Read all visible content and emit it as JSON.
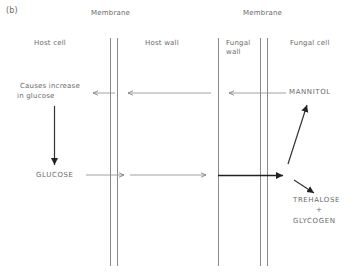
{
  "panel_label": "(b)",
  "headers": {
    "membrane_left": "Membrane",
    "membrane_right": "Membrane",
    "host_cell": "Host cell",
    "host_wall": "Host wall",
    "fungal_wall_line1": "Fungal",
    "fungal_wall_line2": "wall",
    "fungal_cell": "Fungal cell"
  },
  "labels": {
    "causes_line1": "Causes increase",
    "causes_line2": "in glucose",
    "glucose": "GLUCOSE",
    "mannitol": "MANNITOL",
    "trehalose": "TREHALOSE",
    "plus": "+",
    "glycogen": "GLYCOGEN"
  },
  "flows": [
    {
      "from": "MANNITOL",
      "to": "Causes increase in glucose",
      "direction": "left"
    },
    {
      "from": "Causes increase in glucose",
      "to": "GLUCOSE",
      "direction": "down"
    },
    {
      "from": "GLUCOSE",
      "to": "Fungal cell",
      "direction": "right"
    },
    {
      "from": "Fungal cell",
      "to": "MANNITOL",
      "direction": "up-right"
    },
    {
      "from": "Fungal cell",
      "to": "TREHALOSE + GLYCOGEN",
      "direction": "down-right"
    }
  ]
}
